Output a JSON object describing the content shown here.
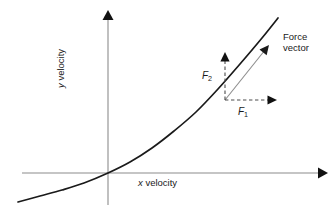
{
  "figure": {
    "background_color": "#ffffff"
  },
  "axes": {
    "x_label_var": "x",
    "x_label_text": " velocity",
    "y_label_var": "y",
    "y_label_text": " velocity",
    "axis_color": "#8c8c8c",
    "origin": {
      "x": 108,
      "y": 173
    },
    "x_axis": {
      "start_x": 22,
      "end_x": 327,
      "y": 173,
      "arrow": "right"
    },
    "y_axis": {
      "x": 108,
      "start_y": 205,
      "end_y": 12,
      "arrow": "up"
    }
  },
  "curve": {
    "color": "#1a1a1a",
    "width": 1.7,
    "description": "exponential-like velocity curve through origin",
    "points": [
      [
        18,
        202
      ],
      [
        40,
        196
      ],
      [
        62,
        190
      ],
      [
        84,
        183
      ],
      [
        108,
        173
      ],
      [
        130,
        162
      ],
      [
        152,
        148
      ],
      [
        174,
        131
      ],
      [
        196,
        112
      ],
      [
        218,
        89
      ],
      [
        240,
        64
      ],
      [
        262,
        38
      ],
      [
        278,
        18
      ]
    ]
  },
  "force_vector": {
    "label_line1": "Force",
    "label_line2": "vector",
    "color": "#8c8c8c",
    "tail": {
      "x": 225,
      "y": 100
    },
    "head": {
      "x": 269,
      "y": 45
    },
    "arrowhead_color": "#1a1a1a"
  },
  "components": {
    "vertical": {
      "symbol": "F",
      "subscript": "2",
      "style": "dashed",
      "color": "#4d4d4d",
      "tail": {
        "x": 225,
        "y": 100
      },
      "head": {
        "x": 225,
        "y": 52
      }
    },
    "horizontal": {
      "symbol": "F",
      "subscript": "1",
      "style": "dashed",
      "color": "#4d4d4d",
      "tail": {
        "x": 225,
        "y": 100
      },
      "head": {
        "x": 277,
        "y": 100
      }
    }
  },
  "tangent_point": {
    "x": 225,
    "y": 100
  }
}
